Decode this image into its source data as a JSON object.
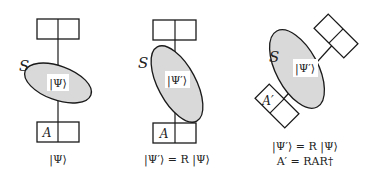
{
  "colors": {
    "stroke": "#1a1a1a",
    "ellipse_fill": "#d9d9d9",
    "label_bg": "#ffffff",
    "background": "#ffffff"
  },
  "panels": [
    {
      "id": "original",
      "system_label": "S",
      "state_label": "|Ψ⟩",
      "observable_label": "A",
      "caption_lines": [
        "|Ψ⟩"
      ]
    },
    {
      "id": "rotated-state",
      "system_label": "S",
      "state_label": "|Ψ′⟩",
      "observable_label": "A",
      "caption_lines": [
        "|Ψ′⟩ = R |Ψ⟩"
      ]
    },
    {
      "id": "rotated-state-and-apparatus",
      "system_label": "S",
      "state_label": "|Ψ′⟩",
      "observable_label": "A′",
      "caption_lines": [
        "|Ψ′⟩ = R |Ψ⟩",
        "A′ = RAR†"
      ]
    }
  ]
}
